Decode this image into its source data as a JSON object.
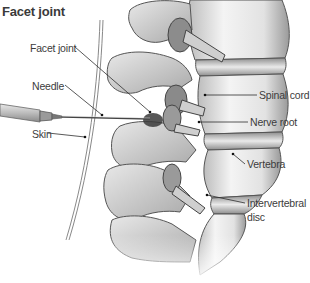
{
  "figure": {
    "title": "Facet joint",
    "labels": {
      "facet_joint": "Facet joint",
      "needle": "Needle",
      "skin": "Skin",
      "spinal_cord": "Spinal cord",
      "nerve_root": "Nerve root",
      "vertebra": "Vertebra",
      "intervertebral_disc_line1": "Intervertebral",
      "intervertebral_disc_line2": "disc"
    },
    "colors": {
      "text": "#3c3c3c",
      "leader_line": "#2e2e2e",
      "bone_light": "#ededed",
      "bone_shade": "#a8a8a8",
      "bone_outline": "#555555",
      "background": "#ffffff"
    }
  }
}
